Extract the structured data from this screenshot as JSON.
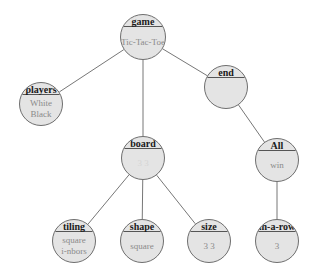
{
  "diagram": {
    "type": "tree",
    "colors": {
      "node_fill": "#e4e4e4",
      "node_border": "#6e6e6e",
      "edge": "#777777",
      "label": "#1a1a1a",
      "value": "#8a8a8a"
    },
    "nodes": [
      {
        "id": "game",
        "label": "game",
        "values": [
          "Tic-Tac-Toe"
        ],
        "cx": 143,
        "cy": 37,
        "r": 23
      },
      {
        "id": "players",
        "label": "players",
        "values": [
          "White",
          "Black"
        ],
        "cx": 41,
        "cy": 104,
        "r": 22
      },
      {
        "id": "end",
        "label": "end",
        "values": [],
        "cx": 226,
        "cy": 87,
        "r": 22
      },
      {
        "id": "board",
        "label": "board",
        "values": [
          "3 3"
        ],
        "faint": true,
        "cx": 143,
        "cy": 158,
        "r": 22
      },
      {
        "id": "all",
        "label": "All",
        "values": [
          "win"
        ],
        "cx": 277,
        "cy": 160,
        "r": 22
      },
      {
        "id": "tiling",
        "label": "tiling",
        "values": [
          "square",
          "i-nbors"
        ],
        "cx": 74,
        "cy": 241,
        "r": 22
      },
      {
        "id": "shape",
        "label": "shape",
        "values": [
          "square"
        ],
        "cx": 142,
        "cy": 241,
        "r": 22
      },
      {
        "id": "size",
        "label": "size",
        "values": [
          "3 3"
        ],
        "cx": 209,
        "cy": 241,
        "r": 22
      },
      {
        "id": "in-a-row",
        "label": "in-a-row",
        "values": [
          "3"
        ],
        "cx": 277,
        "cy": 241,
        "r": 22
      }
    ],
    "edges": [
      [
        "game",
        "players"
      ],
      [
        "game",
        "board"
      ],
      [
        "game",
        "end"
      ],
      [
        "board",
        "tiling"
      ],
      [
        "board",
        "shape"
      ],
      [
        "board",
        "size"
      ],
      [
        "end",
        "all"
      ],
      [
        "all",
        "in-a-row"
      ]
    ]
  }
}
